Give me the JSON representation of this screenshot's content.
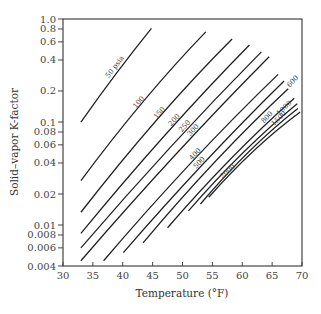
{
  "chart_data": {
    "type": "line",
    "title": "",
    "xlabel": "Temperature (°F)",
    "ylabel": "Solid–vapor K-factor",
    "xlim": [
      30,
      70
    ],
    "ylim": [
      0.004,
      1.0
    ],
    "yscale": "log",
    "grid": false,
    "legend": "none (inline curve labels)",
    "x_ticks": [
      30,
      35,
      40,
      45,
      50,
      55,
      60,
      65,
      70
    ],
    "x_tick_labels": [
      "30",
      "35",
      "40",
      "45",
      "50",
      "55",
      "60",
      "65",
      "70"
    ],
    "y_ticks": [
      0.004,
      0.006,
      0.008,
      0.01,
      0.02,
      0.04,
      0.06,
      0.08,
      0.1,
      0.2,
      0.4,
      0.6,
      0.8,
      1.0
    ],
    "y_tick_labels": [
      "0.004",
      "0.006",
      "0.008",
      "0.01",
      "0.02",
      "0.04",
      "0.06",
      "0.08",
      "0.1",
      "0.2",
      "0.4",
      "0.6",
      "0.8",
      "1.0"
    ],
    "series": [
      {
        "name": "50 psia",
        "label": "50 psia",
        "x": [
          33.0,
          39.0,
          44.8
        ],
        "y": [
          0.1,
          0.3,
          0.81
        ],
        "label_at": 0.55
      },
      {
        "name": "100",
        "label": "100",
        "x": [
          33.0,
          43.5,
          53.9
        ],
        "y": [
          0.027,
          0.16,
          0.75
        ],
        "label_at": 0.5
      },
      {
        "name": "150",
        "label": "150",
        "x": [
          33.0,
          45.7,
          58.3
        ],
        "y": [
          0.0133,
          0.105,
          0.64
        ],
        "label_at": 0.55
      },
      {
        "name": "200",
        "label": "200",
        "x": [
          33.0,
          47.1,
          61.2
        ],
        "y": [
          0.0083,
          0.075,
          0.56
        ],
        "label_at": 0.58
      },
      {
        "name": "250",
        "label": "250",
        "x": [
          33.0,
          48.1,
          63.2
        ],
        "y": [
          0.006,
          0.058,
          0.48
        ],
        "label_at": 0.6
      },
      {
        "name": "300",
        "label": "300",
        "x": [
          33.0,
          48.8,
          64.5
        ],
        "y": [
          0.0045,
          0.048,
          0.43
        ],
        "label_at": 0.62
      },
      {
        "name": "400",
        "label": "400",
        "x": [
          36.8,
          51.4,
          66.0
        ],
        "y": [
          0.0045,
          0.04,
          0.29
        ],
        "label_at": 0.55
      },
      {
        "name": "500",
        "label": "500",
        "x": [
          40.1,
          53.6,
          67.0
        ],
        "y": [
          0.0054,
          0.04,
          0.25
        ],
        "label_at": 0.5
      },
      {
        "name": "600",
        "label": "600",
        "x": [
          43.4,
          55.6,
          67.7
        ],
        "y": [
          0.0067,
          0.042,
          0.21
        ],
        "label_at": 1.0
      },
      {
        "name": "800",
        "label": "800",
        "x": [
          47.5,
          58.1,
          68.7
        ],
        "y": [
          0.0094,
          0.044,
          0.17
        ],
        "label_at": 0.82
      },
      {
        "name": "1000",
        "label": "1000",
        "x": [
          51.0,
          60.1,
          69.2
        ],
        "y": [
          0.0137,
          0.05,
          0.15
        ],
        "label_at": 0.92
      },
      {
        "name": "1500",
        "label": "1500",
        "x": [
          53.0,
          61.2,
          69.3
        ],
        "y": [
          0.016,
          0.052,
          0.135
        ],
        "label_at": 0.85
      },
      {
        "name": "2000",
        "label": "2000",
        "x": [
          54.4,
          62.0,
          69.7
        ],
        "y": [
          0.0186,
          0.053,
          0.125
        ],
        "label_at": 0.25
      }
    ]
  }
}
